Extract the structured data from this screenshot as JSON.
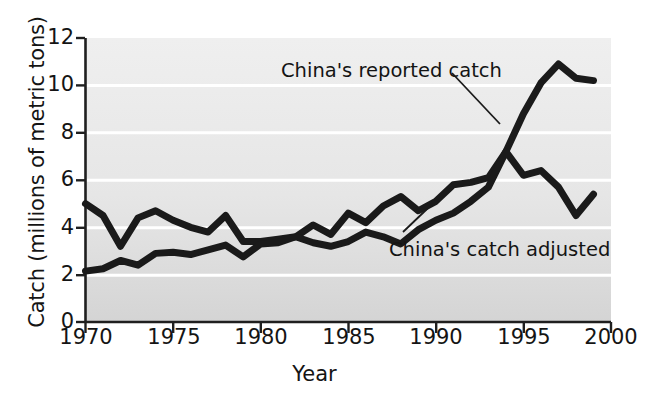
{
  "chart_data": {
    "type": "line",
    "title": "",
    "xlabel": "Year",
    "ylabel": "Catch (millions of metric tons)",
    "xlim": [
      1970,
      2000
    ],
    "ylim": [
      0,
      12
    ],
    "xticks": [
      "1970",
      "1975",
      "1980",
      "1985",
      "1990",
      "1995",
      "2000"
    ],
    "yticks": [
      "0",
      "2",
      "4",
      "6",
      "8",
      "10",
      "12"
    ],
    "grid": "horizontal-white-gridlines",
    "legend": "inline-annotations",
    "x": [
      1970,
      1971,
      1972,
      1973,
      1974,
      1975,
      1976,
      1977,
      1978,
      1979,
      1980,
      1981,
      1982,
      1983,
      1984,
      1985,
      1986,
      1987,
      1988,
      1989,
      1990,
      1991,
      1992,
      1993,
      1994,
      1995,
      1996,
      1997,
      1998,
      1999
    ],
    "series": [
      {
        "name": "China's reported catch",
        "values": [
          5.0,
          4.5,
          3.2,
          4.4,
          4.7,
          4.3,
          4.0,
          3.8,
          4.5,
          3.4,
          3.4,
          3.5,
          3.6,
          4.1,
          3.7,
          4.6,
          4.2,
          4.9,
          5.3,
          4.7,
          5.1,
          5.8,
          5.9,
          6.1,
          7.2,
          8.8,
          10.1,
          10.9,
          10.3,
          10.2
        ],
        "color": "#1a1a1a"
      },
      {
        "name": "China's catch adjusted",
        "values": [
          2.15,
          2.25,
          2.6,
          2.4,
          2.9,
          2.95,
          2.85,
          3.05,
          3.25,
          2.75,
          3.3,
          3.35,
          3.6,
          3.35,
          3.2,
          3.4,
          3.8,
          3.6,
          3.3,
          3.9,
          4.3,
          4.6,
          5.1,
          5.7,
          7.2,
          6.2,
          6.4,
          5.7,
          4.5,
          5.4
        ],
        "color": "#1a1a1a"
      }
    ],
    "annotations": [
      {
        "text": "China's reported catch",
        "points_to_year": 1994,
        "points_to_value": 8.1
      },
      {
        "text": "China's catch adjusted",
        "points_to_year": 1995.6,
        "points_to_value": 6.3
      }
    ]
  },
  "axis": {
    "ylabel": "Catch (millions of metric tons)",
    "xlabel": "Year",
    "ytick_labels": [
      "12",
      "10",
      "8",
      "6",
      "4",
      "2",
      "0"
    ],
    "xtick_labels": [
      "1970",
      "1975",
      "1980",
      "1985",
      "1990",
      "1995",
      "2000"
    ]
  },
  "annotations": {
    "reported": "China's reported catch",
    "adjusted": "China's catch adjusted"
  },
  "colors": {
    "line": "#1a1a1a",
    "plot_bg_top": "#ededed",
    "plot_bg_bottom": "#d9d9d9",
    "gridline": "#ffffff",
    "axis": "#1a1a1a",
    "page_bg": "#ffffff"
  }
}
